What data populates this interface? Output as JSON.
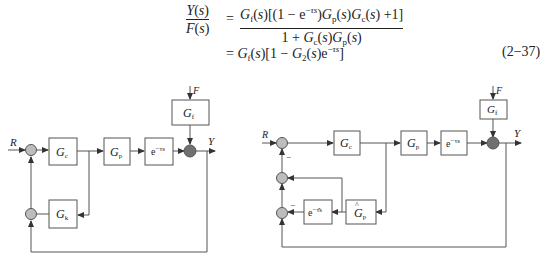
{
  "equation": {
    "lhs_numerator": "Y(s)",
    "lhs_denominator": "F(s)",
    "equals": "=",
    "rhs_numerator": "G_f(s)[(1 − e^{−τs})G_p(s)G_c(s) + 1]",
    "rhs_denominator": "1 + G_c(s)G_p(s)",
    "line2": "= G_f(s)[1 − G_2(s)e^{−τs}]",
    "number": "(2−37)"
  },
  "left_diagram": {
    "input_label": "R",
    "output_label": "Y",
    "disturbance_label": "F",
    "blocks": [
      {
        "id": "Gc",
        "label": "G",
        "sub": "c"
      },
      {
        "id": "Gp",
        "label": "G",
        "sub": "p"
      },
      {
        "id": "delay",
        "label": "e",
        "sup": "−τs"
      },
      {
        "id": "Gf",
        "label": "G",
        "sub": "f"
      },
      {
        "id": "Gk",
        "label": "G",
        "sub": "k"
      }
    ]
  },
  "right_diagram": {
    "input_label": "R",
    "output_label": "Y",
    "disturbance_label": "F",
    "minus_signs": [
      "−",
      "−"
    ],
    "blocks": [
      {
        "id": "Gc",
        "label": "G",
        "sub": "c"
      },
      {
        "id": "Gp",
        "label": "G",
        "sub": "p"
      },
      {
        "id": "delay",
        "label": "e",
        "sup": "−τs"
      },
      {
        "id": "Gf",
        "label": "G",
        "sub": "f"
      },
      {
        "id": "Gp_hat",
        "label": "Ĝ",
        "sub": "p"
      },
      {
        "id": "delay_hat",
        "label": "e",
        "sup": "−τ̂s"
      }
    ]
  },
  "colors": {
    "line": "#555555",
    "sum_light": "#bdbdbd",
    "sum_dark": "#707070"
  }
}
